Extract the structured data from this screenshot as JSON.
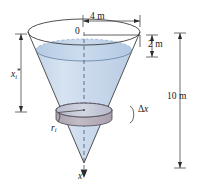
{
  "figure": {
    "labels": {
      "top_width": "4 m",
      "top_gap": "2 m",
      "total_height": "10 m",
      "origin": "0",
      "sample_point_var": "x",
      "sample_point_sub": "i",
      "sample_point_star": "*",
      "thickness_delta": "Δ",
      "thickness_var": "x",
      "radius_var": "r",
      "radius_sub": "i",
      "axis_label": "x"
    },
    "colors": {
      "water_fill": "#c9d8ea",
      "water_fill_light": "#dde7f3",
      "water_surface": "#bdd0e6",
      "disk_band": "#b9b2bd",
      "disk_top": "#cfd3e0",
      "outline": "#3c3c3c",
      "dim_line": "#4a4a4a",
      "axis_dash": "#4a5a78",
      "text": "#1a1a1a"
    },
    "geometry": {
      "cone_rim_center_x": 84,
      "cone_rim_center_y": 32,
      "cone_rim_rx": 56,
      "cone_rim_ry": 13,
      "cone_apex_x": 84,
      "cone_apex_y": 163,
      "water_surface_y": 50,
      "water_surface_rx": 48,
      "water_surface_ry": 11,
      "disk_center_y": 110,
      "disk_rx": 28,
      "disk_ry": 7,
      "disk_thickness": 9
    }
  }
}
